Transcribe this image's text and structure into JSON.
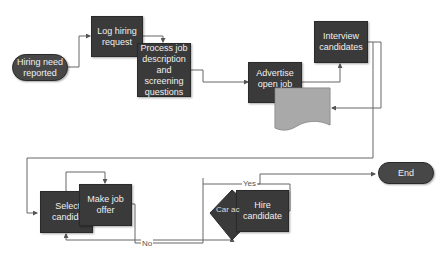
{
  "diagram": {
    "type": "flowchart",
    "title": "",
    "nodes": [
      {
        "id": "start",
        "label": "Hiring need reported",
        "shape": "terminator"
      },
      {
        "id": "log",
        "label": "Log hiring request",
        "shape": "process"
      },
      {
        "id": "process",
        "label": "Process job description and screening questions",
        "shape": "process"
      },
      {
        "id": "advertise",
        "label": "Advertise open job",
        "shape": "process"
      },
      {
        "id": "doc",
        "label": "",
        "shape": "document"
      },
      {
        "id": "interview",
        "label": "Interview candidates",
        "shape": "process"
      },
      {
        "id": "select",
        "label": "Select a candidate",
        "shape": "process"
      },
      {
        "id": "offer",
        "label": "Make job offer",
        "shape": "process"
      },
      {
        "id": "decision",
        "label": "Candidate accepts?",
        "shape": "decision"
      },
      {
        "id": "hire",
        "label": "Hire candidate",
        "shape": "process"
      },
      {
        "id": "end",
        "label": "End",
        "shape": "terminator"
      }
    ],
    "edge_labels": {
      "yes": "Yes",
      "no": "No"
    },
    "visible_text": {
      "start": "Hiring need reported",
      "log": "Log hiring request",
      "process": "Process job description and screening questions",
      "advertise": "Advertise open job",
      "interview": "Interview candidates",
      "select": "Select a candidate",
      "offer": "Make job offer",
      "decision": "Car ac",
      "hire": "Hire candidate",
      "end": "End"
    }
  }
}
